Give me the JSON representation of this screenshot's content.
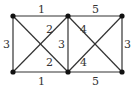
{
  "diagram": {
    "type": "weighted-graph",
    "nodes": [
      {
        "id": "A",
        "position": "top-left"
      },
      {
        "id": "B",
        "position": "top-middle"
      },
      {
        "id": "C",
        "position": "top-right"
      },
      {
        "id": "D",
        "position": "bottom-left"
      },
      {
        "id": "E",
        "position": "bottom-middle"
      },
      {
        "id": "F",
        "position": "bottom-right"
      }
    ],
    "edges": [
      {
        "from": "A",
        "to": "B",
        "weight": "1"
      },
      {
        "from": "B",
        "to": "C",
        "weight": "5"
      },
      {
        "from": "A",
        "to": "D",
        "weight": "3"
      },
      {
        "from": "B",
        "to": "E",
        "weight": "3"
      },
      {
        "from": "C",
        "to": "F",
        "weight": "3"
      },
      {
        "from": "D",
        "to": "E",
        "weight": "1"
      },
      {
        "from": "E",
        "to": "F",
        "weight": "5"
      },
      {
        "from": "A",
        "to": "E",
        "weight": "2"
      },
      {
        "from": "D",
        "to": "B",
        "weight": "2"
      },
      {
        "from": "B",
        "to": "F",
        "weight": "4"
      },
      {
        "from": "E",
        "to": "C",
        "weight": "4"
      }
    ],
    "labels": {
      "top_left_mid": "1",
      "top_mid_right": "5",
      "left_vertical": "3",
      "mid_vertical": "3",
      "right_vertical": "3",
      "bottom_left_mid": "1",
      "bottom_mid_right": "5",
      "left_diag_upper": "2",
      "left_diag_lower": "2",
      "right_diag_upper": "4",
      "right_diag_lower": "4"
    },
    "colors": {
      "edge": "#333333",
      "node": "#111111",
      "background": "#ffffff"
    }
  }
}
